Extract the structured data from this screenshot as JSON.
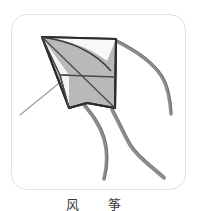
{
  "page": {
    "background_color": "#ffffff",
    "width": 197,
    "height": 211
  },
  "card": {
    "name": "illustration-card",
    "background_color": "#ffffff",
    "border_color": "#e2e2e2",
    "corner_radius": 16
  },
  "illustration": {
    "subject": "kite",
    "description": "Line drawing of a diamond kite with two streaming tails and a flying string",
    "colors": {
      "sail_fill": "#b9b9b9",
      "sail_highlight": "#f2f2f2",
      "outline": "#2b2b2b",
      "spar": "#4a4a4a",
      "tail": "#8c8c8c",
      "tail_edge": "#5a5a5a",
      "string": "#9a9a9a"
    },
    "parts": [
      {
        "name": "kite-sail",
        "label": "sail"
      },
      {
        "name": "kite-spar-horizontal",
        "label": "horizontal spar"
      },
      {
        "name": "kite-spar-diagonal",
        "label": "diagonal spar"
      },
      {
        "name": "kite-tail-left",
        "label": "left tail"
      },
      {
        "name": "kite-tail-right",
        "label": "right tail"
      },
      {
        "name": "kite-tail-upper-right",
        "label": "upper right tail"
      },
      {
        "name": "kite-string",
        "label": "flying string"
      }
    ]
  },
  "caption": {
    "full_text": "风筝",
    "char_1": "风",
    "char_2": "筝"
  }
}
